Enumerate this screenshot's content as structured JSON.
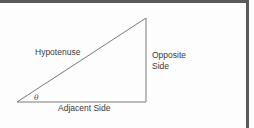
{
  "diagram": {
    "labels": {
      "hypotenuse": "Hypotenuse",
      "opposite_line1": "Opposite",
      "opposite_line2": "Side",
      "adjacent": "Adjacent Side",
      "angle": "θ"
    },
    "vertices": {
      "angle_vertex": [
        17,
        102
      ],
      "right_angle_vertex": [
        146,
        102
      ],
      "top_vertex": [
        146,
        18
      ]
    },
    "colors": {
      "line": "#7a7a7a",
      "text": "#3a3a3a",
      "frame": "#5a5a5a",
      "background": "#fdfdfd"
    }
  }
}
